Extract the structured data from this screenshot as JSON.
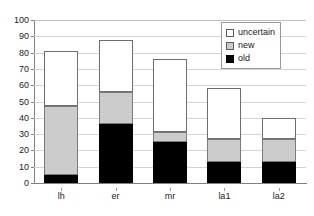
{
  "chart_data": {
    "type": "bar",
    "stacked": true,
    "title": "",
    "xlabel": "",
    "ylabel": "",
    "ylim": [
      0,
      100
    ],
    "yticks": [
      0,
      10,
      20,
      30,
      40,
      50,
      60,
      70,
      80,
      90,
      100
    ],
    "grid": true,
    "legend_position": "top-right",
    "categories": [
      "lh",
      "er",
      "mr",
      "la1",
      "la2"
    ],
    "series": [
      {
        "name": "old",
        "color": "#000000",
        "values": [
          5,
          36,
          25,
          13,
          13
        ]
      },
      {
        "name": "new",
        "color": "#cccccc",
        "values": [
          42,
          20,
          6,
          14,
          14
        ]
      },
      {
        "name": "uncertain",
        "color": "#ffffff",
        "values": [
          34,
          32,
          45,
          31,
          13
        ]
      }
    ],
    "totals": [
      81,
      88,
      76,
      58,
      40
    ]
  },
  "legend": {
    "entries": [
      {
        "label": "uncertain",
        "swatch": "uncertain"
      },
      {
        "label": "new",
        "swatch": "new"
      },
      {
        "label": "old",
        "swatch": "old"
      }
    ]
  },
  "axis": {
    "y_tick_labels": [
      "100",
      "90",
      "80",
      "70",
      "60",
      "50",
      "40",
      "30",
      "20",
      "10",
      "0"
    ],
    "x_tick_labels": [
      "lh",
      "er",
      "mr",
      "la1",
      "la2"
    ]
  },
  "colors": {
    "old": "#000000",
    "new": "#cccccc",
    "uncertain": "#ffffff",
    "grid": "#d4d4d4",
    "axis": "#808080",
    "text": "#1a1a1a"
  }
}
